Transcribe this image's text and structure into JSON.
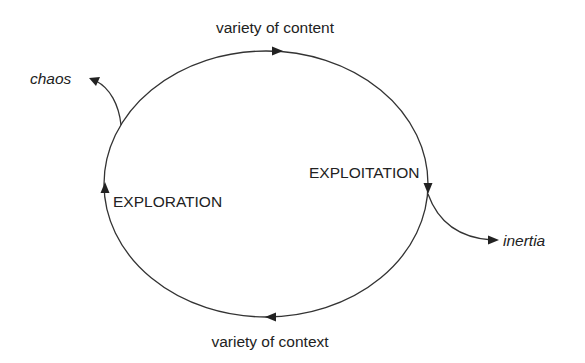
{
  "diagram": {
    "type": "cycle",
    "colors": {
      "stroke": "#333333",
      "text": "#222222",
      "background": "#ffffff"
    },
    "labels": {
      "top": "variety of content",
      "bottom": "variety of context",
      "right_phase": "EXPLOITATION",
      "left_phase": "EXPLORATION",
      "left_outlet": "chaos",
      "right_outlet": "inertia"
    },
    "arrows": [
      {
        "name": "top-arrow",
        "direction": "right"
      },
      {
        "name": "right-arrow",
        "direction": "down"
      },
      {
        "name": "bottom-arrow",
        "direction": "left"
      },
      {
        "name": "left-arrow",
        "direction": "up"
      },
      {
        "name": "chaos-arrow",
        "direction": "up-left"
      },
      {
        "name": "inertia-arrow",
        "direction": "right"
      }
    ]
  }
}
